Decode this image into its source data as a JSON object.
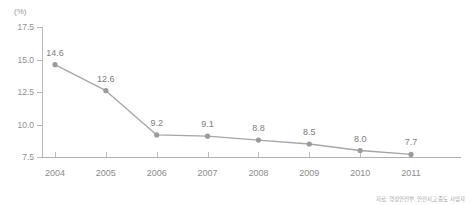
{
  "chart_data": {
    "type": "line",
    "title": "",
    "xlabel": "",
    "ylabel": "",
    "unit_label": "(%)",
    "categories": [
      "2004",
      "2005",
      "2006",
      "2007",
      "2008",
      "2009",
      "2010",
      "2011"
    ],
    "values": [
      14.6,
      12.6,
      9.2,
      9.1,
      8.8,
      8.5,
      8.0,
      7.7
    ],
    "point_labels": [
      "14.6",
      "12.6",
      "9.2",
      "9.1",
      "8.8",
      "8.5",
      "8.0",
      "7.7"
    ],
    "ylim": [
      7.5,
      17.5
    ],
    "yticks": [
      17.5,
      15.0,
      12.5,
      10.0,
      7.5
    ],
    "ytick_labels": [
      "17.5",
      "15.0",
      "12.5",
      "10.0",
      "7.5"
    ],
    "grid": false,
    "legend": null,
    "series": [
      {
        "name": "",
        "values": [
          14.6,
          12.6,
          9.2,
          9.1,
          8.8,
          8.5,
          8.0,
          7.7
        ]
      }
    ]
  },
  "style": {
    "line_color": "#a6a6a6",
    "marker_color": "#9b9b9b",
    "axis_color": "#b5b5b5",
    "text_color": "#8c8c8c",
    "background": "#ffffff"
  },
  "footer": {
    "source_note": "자료: 행정안전부, 안전사고 중도 사망자"
  }
}
